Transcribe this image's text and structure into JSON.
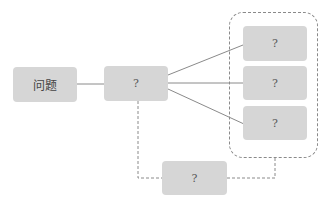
{
  "diagram": {
    "colors": {
      "node_fill": "#d6d6d6",
      "line": "#8a8a8a",
      "text": "#555555"
    },
    "nodes": {
      "root": {
        "label": "问题"
      },
      "middle": {
        "label": "?"
      },
      "right_1": {
        "label": "?"
      },
      "right_2": {
        "label": "?"
      },
      "right_3": {
        "label": "?"
      },
      "bottom": {
        "label": "?"
      }
    },
    "edges": [
      {
        "from": "root",
        "to": "middle",
        "style": "solid"
      },
      {
        "from": "middle",
        "to": "right_1",
        "style": "solid"
      },
      {
        "from": "middle",
        "to": "right_2",
        "style": "solid"
      },
      {
        "from": "middle",
        "to": "right_3",
        "style": "solid"
      },
      {
        "from": "middle",
        "to": "bottom",
        "style": "dashed"
      },
      {
        "from": "bottom",
        "to": "right_group",
        "style": "dashed"
      }
    ],
    "groups": [
      {
        "id": "right_group",
        "members": [
          "right_1",
          "right_2",
          "right_3"
        ],
        "style": "dashed"
      }
    ]
  }
}
